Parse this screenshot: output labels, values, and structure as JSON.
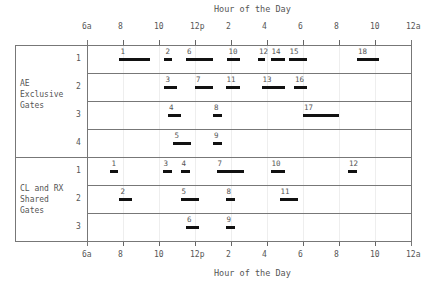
{
  "chart_data": {
    "type": "gantt",
    "title": "",
    "xlabel": "Hour of the Day",
    "x_tick_labels": [
      "6a",
      "8",
      "10",
      "12p",
      "2",
      "4",
      "6",
      "8",
      "10",
      "12a"
    ],
    "x_ticks_hours": [
      6,
      8,
      10,
      12,
      14,
      16,
      18,
      20,
      22,
      24
    ],
    "xlim": [
      6,
      24
    ],
    "grid": true,
    "groups": [
      {
        "name": "AE Exclusive Gates",
        "gates": [
          {
            "gate": "1",
            "flights": [
              {
                "id": "1",
                "start": 7.8,
                "end": 9.5
              },
              {
                "id": "2",
                "start": 10.3,
                "end": 10.7
              },
              {
                "id": "6",
                "start": 11.5,
                "end": 13.0
              },
              {
                "id": "10",
                "start": 13.8,
                "end": 14.5
              },
              {
                "id": "12",
                "start": 15.5,
                "end": 15.9
              },
              {
                "id": "14",
                "start": 16.2,
                "end": 17.0
              },
              {
                "id": "15",
                "start": 17.2,
                "end": 18.2
              },
              {
                "id": "18",
                "start": 21.0,
                "end": 22.2
              }
            ]
          },
          {
            "gate": "2",
            "flights": [
              {
                "id": "3",
                "start": 10.3,
                "end": 11.0
              },
              {
                "id": "7",
                "start": 12.0,
                "end": 13.0
              },
              {
                "id": "11",
                "start": 13.7,
                "end": 14.5
              },
              {
                "id": "13",
                "start": 15.7,
                "end": 17.0
              },
              {
                "id": "16",
                "start": 17.5,
                "end": 18.2
              }
            ]
          },
          {
            "gate": "3",
            "flights": [
              {
                "id": "4",
                "start": 10.5,
                "end": 11.2
              },
              {
                "id": "8",
                "start": 13.0,
                "end": 13.5
              },
              {
                "id": "17",
                "start": 18.0,
                "end": 20.0
              }
            ]
          },
          {
            "gate": "4",
            "flights": [
              {
                "id": "5",
                "start": 10.8,
                "end": 11.8
              },
              {
                "id": "9",
                "start": 13.0,
                "end": 13.5
              }
            ]
          }
        ]
      },
      {
        "name": "CL and RX Shared Gates",
        "gates": [
          {
            "gate": "1",
            "flights": [
              {
                "id": "1",
                "start": 7.3,
                "end": 7.7
              },
              {
                "id": "3",
                "start": 10.2,
                "end": 10.7
              },
              {
                "id": "4",
                "start": 11.2,
                "end": 11.7
              },
              {
                "id": "7",
                "start": 13.2,
                "end": 14.7
              },
              {
                "id": "10",
                "start": 16.2,
                "end": 17.0
              },
              {
                "id": "12",
                "start": 20.5,
                "end": 21.0
              }
            ]
          },
          {
            "gate": "2",
            "flights": [
              {
                "id": "2",
                "start": 7.8,
                "end": 8.5
              },
              {
                "id": "5",
                "start": 11.2,
                "end": 12.2
              },
              {
                "id": "8",
                "start": 13.7,
                "end": 14.2
              },
              {
                "id": "11",
                "start": 16.7,
                "end": 17.7
              }
            ]
          },
          {
            "gate": "3",
            "flights": [
              {
                "id": "6",
                "start": 11.5,
                "end": 12.2
              },
              {
                "id": "9",
                "start": 13.7,
                "end": 14.2
              }
            ]
          }
        ]
      }
    ]
  },
  "labels": {
    "top_axis_title": "Hour of the Day",
    "bottom_axis_title": "Hour of the Day",
    "group_ae": "AE\nExclusive\nGates",
    "group_cl": "CL and RX\nShared\nGates"
  }
}
